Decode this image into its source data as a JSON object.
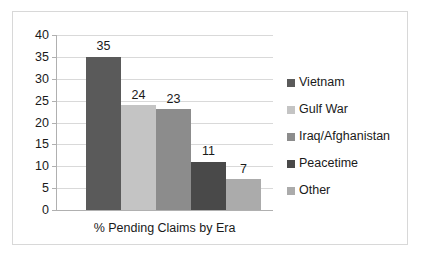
{
  "chart_data": {
    "type": "bar",
    "title": "",
    "xlabel": "% Pending Claims by Era",
    "ylabel": "",
    "categories": [
      "Vietnam",
      "Gulf War",
      "Iraq/Afghanistan",
      "Peacetime",
      "Other"
    ],
    "values": [
      35,
      24,
      23,
      11,
      7
    ],
    "value_labels": [
      "35",
      "24",
      "23",
      "11",
      "7"
    ],
    "ylim": [
      0,
      40
    ],
    "yticks": [
      0,
      5,
      10,
      15,
      20,
      25,
      30,
      35,
      40
    ],
    "ytick_labels": [
      "0",
      "5",
      "10",
      "15",
      "20",
      "25",
      "30",
      "35",
      "40"
    ],
    "grid": true,
    "legend_position": "right",
    "legend": [
      {
        "label": "Vietnam",
        "color": "#5a5a5a"
      },
      {
        "label": "Gulf War",
        "color": "#c4c4c4"
      },
      {
        "label": "Iraq/Afghanistan",
        "color": "#8c8c8c"
      },
      {
        "label": "Peacetime",
        "color": "#494949"
      },
      {
        "label": "Other",
        "color": "#ababab"
      }
    ],
    "bar_colors": [
      "#5a5a5a",
      "#c4c4c4",
      "#8c8c8c",
      "#494949",
      "#ababab"
    ],
    "colors": {
      "grid": "#d9d9d9",
      "axis": "#b0b0b0",
      "text": "#1a1a1a",
      "border": "#d8d8d8",
      "background": "#ffffff"
    }
  }
}
